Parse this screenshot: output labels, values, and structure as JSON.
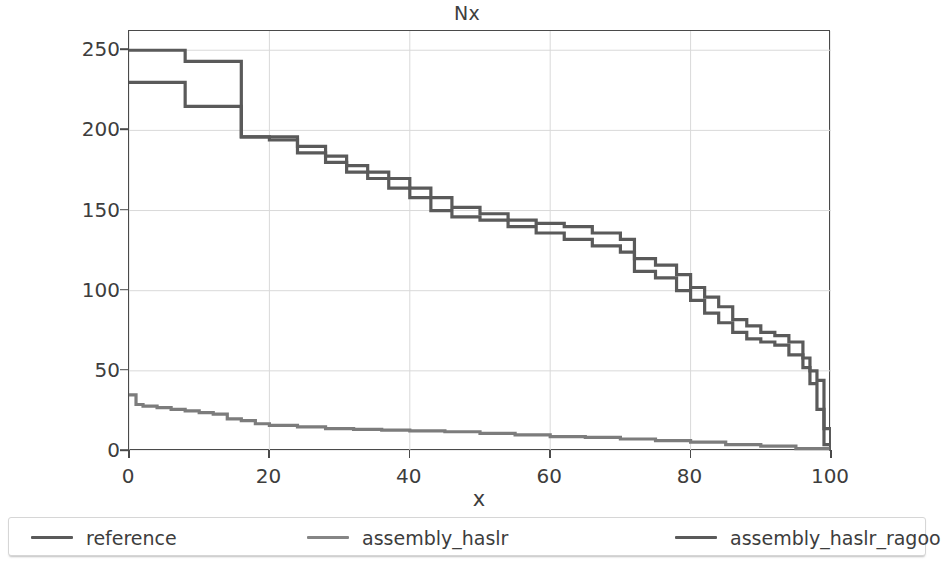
{
  "chart_data": {
    "type": "line",
    "title": "Nx",
    "xlabel": "x",
    "ylabel": "Contig length (Mbp)",
    "xlim": [
      0,
      100
    ],
    "ylim": [
      0,
      262
    ],
    "grid": true,
    "legend_position": "below-figure",
    "xticks": [
      0,
      20,
      40,
      60,
      80,
      100
    ],
    "yticks": [
      0,
      50,
      100,
      150,
      200,
      250
    ],
    "drawstyle": "steps-post",
    "series": [
      {
        "name": "reference",
        "color": "#5a5a5a",
        "x": [
          0,
          8,
          16,
          20,
          24,
          28,
          31,
          34,
          37,
          40,
          43,
          46,
          50,
          54,
          58,
          62,
          66,
          70,
          72,
          75,
          78,
          80,
          82,
          84,
          86,
          88,
          90,
          92,
          94,
          96,
          97,
          98,
          99,
          100
        ],
        "values": [
          230,
          215,
          196,
          194,
          186,
          180,
          174,
          170,
          164,
          158,
          150,
          146,
          144,
          140,
          136,
          132,
          128,
          124,
          112,
          108,
          100,
          94,
          86,
          80,
          74,
          70,
          68,
          66,
          60,
          52,
          42,
          26,
          4,
          0
        ]
      },
      {
        "name": "assembly_haslr",
        "color": "#7c7c7c",
        "x": [
          0,
          1,
          2,
          4,
          6,
          8,
          10,
          12,
          14,
          16,
          18,
          20,
          24,
          28,
          32,
          36,
          40,
          45,
          50,
          55,
          60,
          65,
          70,
          75,
          80,
          85,
          90,
          95,
          100
        ],
        "values": [
          35,
          29,
          28,
          27,
          26,
          25,
          24,
          23,
          20,
          19,
          17,
          16,
          15,
          14,
          13.5,
          13,
          12.5,
          12,
          11,
          10,
          9,
          8.5,
          7.5,
          6.5,
          5.5,
          4,
          3,
          1.5,
          0
        ]
      },
      {
        "name": "assembly_haslr_ragoo",
        "color": "#5a5a5a",
        "x": [
          0,
          8,
          16,
          20,
          24,
          28,
          31,
          34,
          37,
          40,
          43,
          46,
          50,
          54,
          58,
          62,
          66,
          70,
          72,
          75,
          78,
          80,
          82,
          84,
          86,
          88,
          90,
          92,
          94,
          96,
          97,
          98,
          99,
          100
        ],
        "values": [
          250,
          243,
          196,
          196,
          190,
          184,
          178,
          174,
          170,
          164,
          158,
          152,
          148,
          144,
          142,
          140,
          136,
          132,
          120,
          116,
          110,
          102,
          96,
          90,
          82,
          78,
          74,
          72,
          68,
          58,
          50,
          44,
          14,
          0
        ]
      }
    ]
  },
  "axes": {
    "ytick_labels": [
      "0",
      "50",
      "100",
      "150",
      "200",
      "250"
    ],
    "xtick_labels": [
      "0",
      "20",
      "40",
      "60",
      "80",
      "100"
    ]
  },
  "legend": {
    "entries": [
      {
        "label": "reference",
        "color": "#5a5a5a"
      },
      {
        "label": "assembly_haslr",
        "color": "#858585"
      },
      {
        "label": "assembly_haslr_ragoo",
        "color": "#5a5a5a"
      }
    ]
  },
  "style": {
    "grid_color": "#d9d9d9",
    "axis_color": "#4a4a4a",
    "text_color": "#3d3d3d",
    "background": "#ffffff"
  }
}
